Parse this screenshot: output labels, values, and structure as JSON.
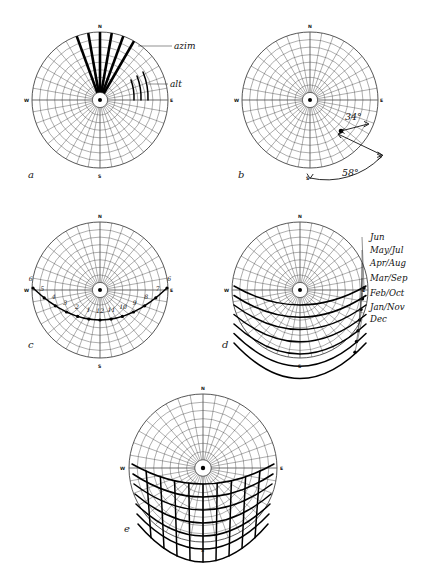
{
  "figure": {
    "type": "sun-path-diagram-series",
    "background": "#ffffff",
    "ink_color": "#1a1a1a",
    "panels": [
      {
        "id": "a",
        "letter": "a",
        "caption_letter": "a",
        "role": "azimuth and altitude coordinate demonstration",
        "cardinals": {
          "n": "N",
          "e": "E",
          "s": "S",
          "w": "W"
        },
        "annotations": [
          {
            "name": "azim",
            "label": "azim"
          },
          {
            "name": "alt",
            "label": "alt"
          }
        ]
      },
      {
        "id": "b",
        "letter": "b",
        "caption_letter": "b",
        "role": "single sun position with measured angles",
        "cardinals": {
          "n": "N",
          "e": "E",
          "s": "S",
          "w": "W"
        },
        "angles": [
          {
            "name": "altitude",
            "label": "34°",
            "value": 34,
            "unit": "degrees"
          },
          {
            "name": "azimuth",
            "label": "58°",
            "value": 58,
            "unit": "degrees"
          }
        ]
      },
      {
        "id": "c",
        "letter": "c",
        "caption_letter": "c",
        "role": "single day sun path with hour markers",
        "cardinals": {
          "n": "N",
          "e": "E",
          "s": "S",
          "w": "W"
        },
        "hour_labels": [
          "6",
          "5",
          "4",
          "3",
          "2",
          "1",
          "12",
          "11",
          "10",
          "9",
          "8",
          "7",
          "6"
        ]
      },
      {
        "id": "d",
        "letter": "d",
        "caption_letter": "d",
        "role": "monthly sun paths",
        "cardinals": {
          "n": "N",
          "e": "E",
          "s": "S",
          "w": "W"
        },
        "month_labels": [
          "Jun",
          "May/Jul",
          "Apr/Aug",
          "Mar/Sep",
          "Feb/Oct",
          "Jan/Nov",
          "Dec"
        ]
      },
      {
        "id": "e",
        "letter": "e",
        "caption_letter": "e",
        "role": "complete sun path chart with hour lines",
        "cardinals": {
          "n": "N",
          "e": "E",
          "s": "S",
          "w": "W"
        }
      }
    ]
  },
  "chart_data": {
    "type": "line",
    "title": "",
    "projection": "equidistant polar (horizon coordinate)",
    "grid": {
      "altitude_rings_deg": [
        10,
        20,
        30,
        40,
        50,
        60,
        70,
        80,
        90
      ],
      "azimuth_spokes_deg_step": 10,
      "center_represents": "zenith",
      "outer_circle_represents": "horizon"
    },
    "xlabel": "azimuth",
    "ylabel": "altitude",
    "panel_b_reading": {
      "altitude_deg": 34,
      "azimuth_deg": 58
    },
    "panel_c_hours": [
      "6",
      "5",
      "4",
      "3",
      "2",
      "1",
      "12",
      "11",
      "10",
      "9",
      "8",
      "7",
      "6"
    ],
    "panel_d_series": [
      {
        "name": "Jun",
        "peak_altitude_deg": 72
      },
      {
        "name": "May/Jul",
        "peak_altitude_deg": 68
      },
      {
        "name": "Apr/Aug",
        "peak_altitude_deg": 60
      },
      {
        "name": "Mar/Sep",
        "peak_altitude_deg": 49
      },
      {
        "name": "Feb/Oct",
        "peak_altitude_deg": 38
      },
      {
        "name": "Jan/Nov",
        "peak_altitude_deg": 30
      },
      {
        "name": "Dec",
        "peak_altitude_deg": 26
      }
    ],
    "legend_position": "right of panel d"
  }
}
